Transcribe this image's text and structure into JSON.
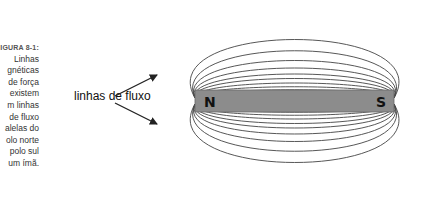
{
  "figure": {
    "label": "FIGURA 8-1:",
    "caption_lines": [
      "Linhas",
      "magnéticas",
      "de força",
      "existem",
      "em linhas",
      "de fluxo",
      "paralelas do",
      "polo norte",
      "ao polo sul",
      "de um ímã."
    ],
    "visible_caption_lines": [
      "Linhas",
      "gnéticas",
      "de força",
      "existem",
      "m linhas",
      "de fluxo",
      "alelas do",
      "olo norte",
      "polo sul",
      "um ímã."
    ],
    "visible_label": "IGURA 8-1:"
  },
  "diagram": {
    "annotation": "linhas de fluxo",
    "magnet": {
      "north_label": "N",
      "south_label": "S",
      "color": "#8c8c8c"
    },
    "line_color": "#444444"
  }
}
